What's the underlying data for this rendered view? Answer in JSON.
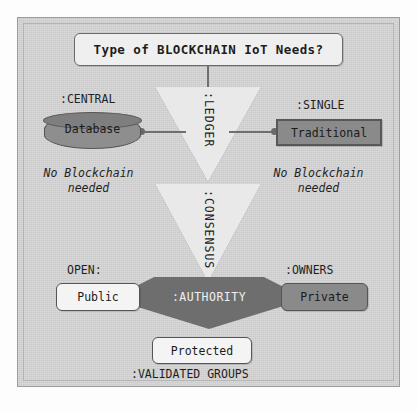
{
  "diagram": {
    "title": "Type of BLOCKCHAIN IoT Needs?",
    "decisions": [
      {
        "id": "ledger",
        "label": ":LEDGER"
      },
      {
        "id": "consensus",
        "label": ":CONSENSUS"
      },
      {
        "id": "authority",
        "label": ":AUTHORITY"
      }
    ],
    "outcomes": [
      {
        "id": "database",
        "label": "Database",
        "edge_label": ":CENTRAL",
        "shape": "cylinder"
      },
      {
        "id": "traditional",
        "label": "Traditional",
        "edge_label": ":SINGLE",
        "shape": "rect"
      },
      {
        "id": "public",
        "label": "Public",
        "edge_label": "OPEN:",
        "shape": "rounded-rect"
      },
      {
        "id": "private",
        "label": "Private",
        "edge_label": ":OWNERS",
        "shape": "rounded-rect"
      },
      {
        "id": "protected",
        "label": "Protected",
        "edge_label": ":VALIDATED GROUPS",
        "shape": "rounded-rect"
      }
    ],
    "annotations": [
      {
        "id": "left-note",
        "text_line1": "No Blockchain",
        "text_line2": "needed"
      },
      {
        "id": "right-note",
        "text_line1": "No Blockchain",
        "text_line2": "needed"
      }
    ],
    "colors": {
      "page_background": "#cdcdcd",
      "frame_border": "#9c9c9c",
      "triangle_fill": "#e9e9e9",
      "diamond_fill": "#6e6e6e",
      "diamond_text": "#f0f0f0",
      "dark_node_fill": "#8a8a8a",
      "light_node_fill": "#f4f4f4",
      "connector": "#6f6f6f",
      "text": "#1f1f1f"
    }
  }
}
